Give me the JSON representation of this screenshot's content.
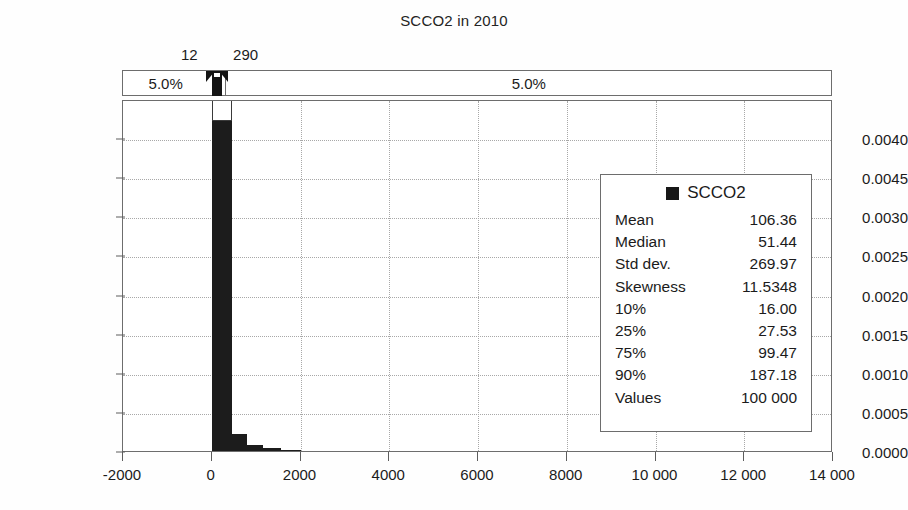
{
  "chart_data": {
    "type": "bar",
    "title": "SCCO2 in 2010",
    "xlabel": "",
    "ylabel": "",
    "xlim": [
      -2000,
      14000
    ],
    "ylim": [
      0.0,
      0.0045
    ],
    "grid": true,
    "legend_position": "right-inside",
    "x_ticks": [
      {
        "value": -2000,
        "label": "-2000"
      },
      {
        "value": 0,
        "label": "0"
      },
      {
        "value": 2000,
        "label": "2000"
      },
      {
        "value": 4000,
        "label": "4000"
      },
      {
        "value": 6000,
        "label": "6000"
      },
      {
        "value": 8000,
        "label": "8000"
      },
      {
        "value": 10000,
        "label": "10 000"
      },
      {
        "value": 12000,
        "label": "12 000"
      },
      {
        "value": 14000,
        "label": "14 000"
      }
    ],
    "y_ticks": [
      {
        "value": 0.004,
        "label": "0.0040"
      },
      {
        "value": 0.0035,
        "label": "0.0045"
      },
      {
        "value": 0.003,
        "label": "0.0030"
      },
      {
        "value": 0.0025,
        "label": "0.0025"
      },
      {
        "value": 0.002,
        "label": "0.0020"
      },
      {
        "value": 0.0015,
        "label": "0.0015"
      },
      {
        "value": 0.001,
        "label": "0.0010"
      },
      {
        "value": 0.0005,
        "label": "0.0005"
      },
      {
        "value": 0.0,
        "label": "0.0000"
      }
    ],
    "series": [
      {
        "name": "SCCO2",
        "color": "#1c1c1c",
        "bins": [
          {
            "x0": 0,
            "x1": 450,
            "density": 0.00425
          },
          {
            "x0": 450,
            "x1": 800,
            "density": 0.00022
          },
          {
            "x0": 800,
            "x1": 1150,
            "density": 8e-05
          },
          {
            "x0": 1150,
            "x1": 1550,
            "density": 4e-05
          },
          {
            "x0": 1550,
            "x1": 2000,
            "density": 1.2e-05
          },
          {
            "x0": 2000,
            "x1": 2600,
            "density": 6e-06
          },
          {
            "x0": 2600,
            "x1": 3400,
            "density": 4e-06
          },
          {
            "x0": 3400,
            "x1": 4400,
            "density": 3e-06
          },
          {
            "x0": 4400,
            "x1": 6000,
            "density": 2e-06
          },
          {
            "x0": 6000,
            "x1": 8500,
            "density": 1.5e-06
          },
          {
            "x0": 8500,
            "x1": 12200,
            "density": 1e-06
          }
        ]
      }
    ],
    "percentile_band": {
      "left_label": "5.0%",
      "right_label": "5.0%",
      "lower_bound": "12",
      "upper_bound": "290",
      "lower_bound_value": 12,
      "upper_bound_value": 290
    },
    "legend": {
      "series_label": "SCCO2",
      "stats": [
        {
          "key": "Mean",
          "value": "106.36"
        },
        {
          "key": "Median",
          "value": "51.44"
        },
        {
          "key": "Std dev.",
          "value": "269.97"
        },
        {
          "key": "Skewness",
          "value": "11.5348"
        },
        {
          "key": "10%",
          "value": "16.00"
        },
        {
          "key": "25%",
          "value": "27.53"
        },
        {
          "key": "75%",
          "value": "99.47"
        },
        {
          "key": "90%",
          "value": "187.18"
        },
        {
          "key": "Values",
          "value": "100 000"
        }
      ]
    }
  }
}
